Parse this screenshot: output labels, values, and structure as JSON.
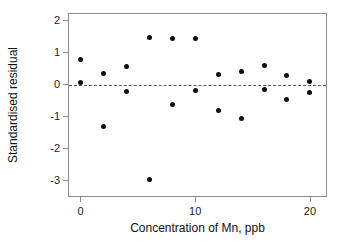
{
  "chart_data": {
    "type": "scatter",
    "title": "",
    "xlabel": "Concentration of Mn, ppb",
    "ylabel": "Standardised residual",
    "xlim": [
      -1.0,
      21.4
    ],
    "ylim": [
      -3.5,
      2.2
    ],
    "xticks": [
      0,
      10,
      20
    ],
    "xtick_labels": [
      "0",
      "10",
      "20"
    ],
    "yticks": [
      2,
      1,
      0,
      -1,
      -2,
      -3
    ],
    "ytick_labels": [
      "2",
      "1",
      "0",
      "-1",
      "-2",
      "-3"
    ],
    "grid": false,
    "legend": "none",
    "marker": "filled-circle",
    "marker_color": "#0c0c0c",
    "frame_color": "#8d8d8d",
    "reference_line": {
      "type": "horizontal-dashed",
      "y": -0.03,
      "color": "#555555"
    },
    "x": [
      0,
      0,
      2,
      2,
      4,
      4,
      6,
      6,
      8,
      8,
      10,
      10,
      12,
      12,
      14,
      14,
      16,
      16,
      18,
      18,
      20,
      20
    ],
    "y": [
      0.77,
      0.05,
      0.33,
      -1.33,
      0.55,
      -0.22,
      1.47,
      -2.97,
      1.43,
      -0.62,
      1.43,
      -0.19,
      0.31,
      -0.81,
      0.4,
      -1.07,
      0.58,
      -0.15,
      0.28,
      -0.48,
      0.1,
      -0.25
    ],
    "points": [
      {
        "x": 0,
        "y": 0.77
      },
      {
        "x": 0,
        "y": 0.05
      },
      {
        "x": 2,
        "y": 0.33
      },
      {
        "x": 2,
        "y": -1.33
      },
      {
        "x": 4,
        "y": 0.55
      },
      {
        "x": 4,
        "y": -0.22
      },
      {
        "x": 6,
        "y": 1.47
      },
      {
        "x": 6,
        "y": -2.97
      },
      {
        "x": 8,
        "y": 1.43
      },
      {
        "x": 8,
        "y": -0.62
      },
      {
        "x": 10,
        "y": 1.43
      },
      {
        "x": 10,
        "y": -0.19
      },
      {
        "x": 12,
        "y": 0.31
      },
      {
        "x": 12,
        "y": -0.81
      },
      {
        "x": 14,
        "y": 0.4
      },
      {
        "x": 14,
        "y": -1.07
      },
      {
        "x": 16,
        "y": 0.58
      },
      {
        "x": 16,
        "y": -0.15
      },
      {
        "x": 18,
        "y": 0.28
      },
      {
        "x": 18,
        "y": -0.48
      },
      {
        "x": 20,
        "y": 0.1
      },
      {
        "x": 20,
        "y": -0.25
      }
    ]
  }
}
